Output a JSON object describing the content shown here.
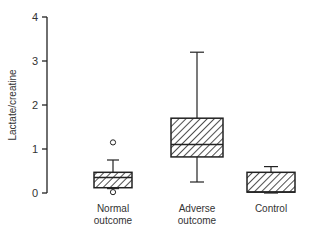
{
  "chart_data": {
    "type": "box",
    "title": "",
    "xlabel": "",
    "ylabel": "Lactate/creatine",
    "ylim": [
      0,
      4
    ],
    "yticks": [
      0,
      1,
      2,
      3,
      4
    ],
    "grid": false,
    "legend": null,
    "categories": [
      "Normal\noutcome",
      "Adverse\noutcome",
      "Control"
    ],
    "series": [
      {
        "name": "Normal outcome",
        "min": 0.1,
        "q1": 0.12,
        "median": 0.35,
        "q3": 0.47,
        "max": 0.75,
        "outliers": [
          1.15,
          0.02
        ]
      },
      {
        "name": "Adverse outcome",
        "min": 0.25,
        "q1": 0.82,
        "median": 1.1,
        "q3": 1.7,
        "max": 3.2,
        "outliers": []
      },
      {
        "name": "Control",
        "min": 0.0,
        "q1": 0.02,
        "median": 0.02,
        "q3": 0.47,
        "max": 0.6,
        "outliers": []
      }
    ]
  },
  "labels": {
    "y_title": "Lactate/creatine",
    "cat_0_line1": "Normal",
    "cat_0_line2": "outcome",
    "cat_1_line1": "Adverse",
    "cat_1_line2": "outcome",
    "cat_2_line1": "Control"
  }
}
